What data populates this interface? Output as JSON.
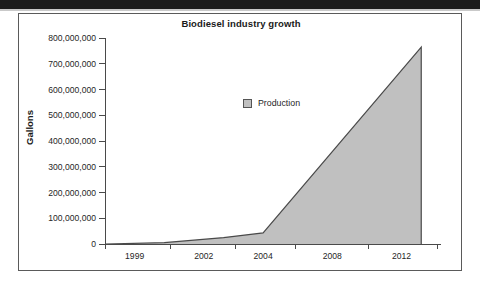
{
  "chart_data": {
    "type": "area",
    "title": "Biodiesel industry growth",
    "xlabel": "",
    "ylabel": "Gallons",
    "legend": [
      {
        "name": "Production",
        "color": "#c0c0c0"
      }
    ],
    "legend_position": "inside-top-left",
    "grid": false,
    "xlim": [
      1996,
      2013
    ],
    "ylim": [
      0,
      800000000
    ],
    "y_ticks": [
      {
        "value": 800000000,
        "label": "800,000,000"
      },
      {
        "value": 700000000,
        "label": "700,000,000"
      },
      {
        "value": 600000000,
        "label": "600,000,000"
      },
      {
        "value": 500000000,
        "label": "500,000,000"
      },
      {
        "value": 400000000,
        "label": "400,000,000"
      },
      {
        "value": 300000000,
        "label": "300,000,000"
      },
      {
        "value": 200000000,
        "label": "200,000,000"
      },
      {
        "value": 100000000,
        "label": "100,000,000"
      },
      {
        "value": 0,
        "label": "0"
      }
    ],
    "x_ticks": [
      {
        "value": 1997.5,
        "label": "1999"
      },
      {
        "value": 2001.0,
        "label": "2002"
      },
      {
        "value": 2004.0,
        "label": "2004"
      },
      {
        "value": 2007.5,
        "label": "2008"
      },
      {
        "value": 2011.0,
        "label": "2012"
      }
    ],
    "series": [
      {
        "name": "Production",
        "x": [
          1996,
          1999,
          2002,
          2004,
          2012,
          2012
        ],
        "values": [
          0,
          5000000,
          25000000,
          43000000,
          765000000,
          0
        ]
      }
    ]
  },
  "figure": {
    "title": "Biodiesel industry growth",
    "y_axis_title": "Gallons",
    "legend_label": "Production",
    "accent_fill": "#c0c0c0",
    "line_color": "#4a4a4a"
  }
}
